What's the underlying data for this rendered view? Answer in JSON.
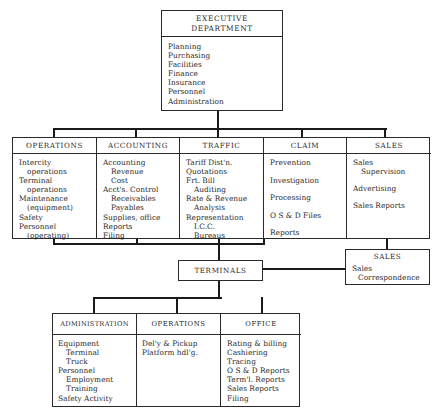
{
  "executive": {
    "title_line1": "EXECUTIVE",
    "title_line2": "DEPARTMENT",
    "items": [
      "Planning",
      "Purchasing",
      "Facilities",
      "Finance",
      "Insurance",
      "Personnel",
      "Administration"
    ]
  },
  "departments": [
    {
      "title": "OPERATIONS",
      "items": [
        {
          "text": "Intercity",
          "indent": false
        },
        {
          "text": "operations",
          "indent": true
        },
        {
          "text": "Terminal",
          "indent": false
        },
        {
          "text": "operations",
          "indent": true
        },
        {
          "text": "Maintenance",
          "indent": false
        },
        {
          "text": "(equipment)",
          "indent": true
        },
        {
          "text": "Safety",
          "indent": false
        },
        {
          "text": "Personnel",
          "indent": false
        },
        {
          "text": "(operating)",
          "indent": true
        }
      ]
    },
    {
      "title": "ACCOUNTING",
      "items": [
        {
          "text": "Accounting",
          "indent": false
        },
        {
          "text": "Revenue",
          "indent": true
        },
        {
          "text": "Cost",
          "indent": true
        },
        {
          "text": "Acct's. Control",
          "indent": false
        },
        {
          "text": "Receivables",
          "indent": true
        },
        {
          "text": "Payables",
          "indent": true
        },
        {
          "text": "Supplies, office",
          "indent": false
        },
        {
          "text": "Reports",
          "indent": false
        },
        {
          "text": "Filing",
          "indent": false
        }
      ]
    },
    {
      "title": "TRAFFIC",
      "items": [
        {
          "text": "Tariff Dist'n.",
          "indent": false
        },
        {
          "text": "Quotations",
          "indent": false
        },
        {
          "text": "Frt. Bill",
          "indent": false
        },
        {
          "text": "Auditing",
          "indent": true
        },
        {
          "text": "Rate & Revenue",
          "indent": false
        },
        {
          "text": "Analysis",
          "indent": true
        },
        {
          "text": "Representation",
          "indent": false
        },
        {
          "text": "I.C.C.",
          "indent": true
        },
        {
          "text": "Bureaus",
          "indent": true
        }
      ]
    },
    {
      "title": "CLAIM",
      "items": [
        {
          "text": "Prevention",
          "indent": false
        },
        {
          "text": "Investigation",
          "indent": false
        },
        {
          "text": "Processing",
          "indent": false
        },
        {
          "text": "O S & D Files",
          "indent": false
        },
        {
          "text": "Reports",
          "indent": false
        }
      ]
    },
    {
      "title": "SALES",
      "items": [
        {
          "text": "Sales",
          "indent": false
        },
        {
          "text": "Supervision",
          "indent": true
        },
        {
          "text": "",
          "indent": false
        },
        {
          "text": "Advertising",
          "indent": false
        },
        {
          "text": "",
          "indent": false
        },
        {
          "text": "Sales Reports",
          "indent": false
        }
      ]
    }
  ],
  "terminals": {
    "title": "TERMINALS"
  },
  "sales_correspondence": {
    "title": "SALES",
    "line1": "Sales",
    "line2": "Correspondence"
  },
  "terminal_units": [
    {
      "title": "ADMINISTRATION",
      "items": [
        {
          "text": "Equipment",
          "indent": false
        },
        {
          "text": "Terminal",
          "indent": true
        },
        {
          "text": "Truck",
          "indent": true
        },
        {
          "text": "Personnel",
          "indent": false
        },
        {
          "text": "Employment",
          "indent": true
        },
        {
          "text": "Training",
          "indent": true
        },
        {
          "text": "Safety Activity",
          "indent": false
        }
      ]
    },
    {
      "title": "OPERATIONS",
      "items": [
        {
          "text": "Del'y & Pickup",
          "indent": false
        },
        {
          "text": "Platform hdl'g.",
          "indent": false
        }
      ]
    },
    {
      "title": "OFFICE",
      "items": [
        {
          "text": "Rating & billing",
          "indent": false
        },
        {
          "text": "Cashiering",
          "indent": false
        },
        {
          "text": "Tracing",
          "indent": false
        },
        {
          "text": "O S & D Reports",
          "indent": false
        },
        {
          "text": "Term'l. Reports",
          "indent": false
        },
        {
          "text": "Sales Reports",
          "indent": false
        },
        {
          "text": "Filing",
          "indent": false
        }
      ]
    }
  ]
}
